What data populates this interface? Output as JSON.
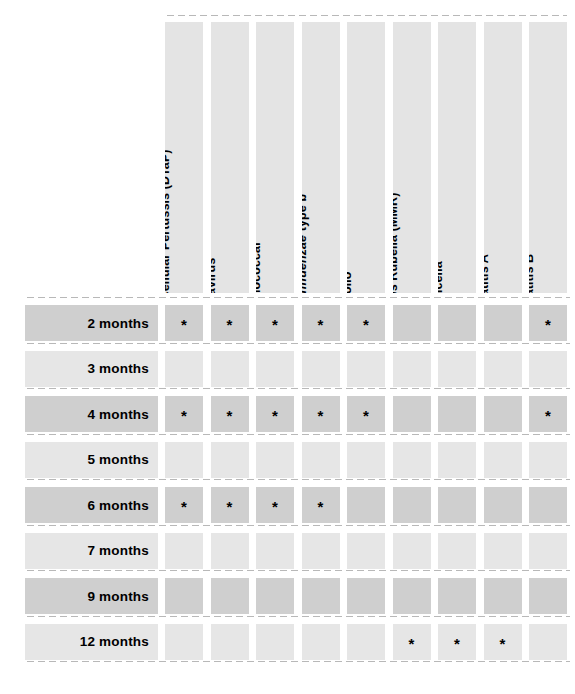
{
  "table": {
    "marker": "*",
    "colors": {
      "row_shade_dark": "#cfcfcf",
      "row_shade_light": "#e6e6e6",
      "header_shade": "#e4e4e4",
      "dot_color": "#b8b8b8",
      "text": "#000000",
      "background": "#ffffff"
    },
    "columns": [
      {
        "id": "dtap",
        "label": "Diphtheria Tetanus Acellular Pertussis (DTaP)",
        "italic_part": "",
        "roman_part": "Diphtheria Tetanus Acellular Pertussis (DTaP)"
      },
      {
        "id": "rotavirus",
        "label": "Rotavirus",
        "italic_part": "",
        "roman_part": "Rotavirus"
      },
      {
        "id": "pneumococcal",
        "label": "Pneumococcal",
        "italic_part": "",
        "roman_part": "Pneumococcal"
      },
      {
        "id": "hib",
        "label": "Haemophilus influenzae type b",
        "italic_part": "Haemophilus influenzae",
        "roman_part": " type b"
      },
      {
        "id": "polio",
        "label": "Polio",
        "italic_part": "",
        "roman_part": "Polio"
      },
      {
        "id": "mmr",
        "label": "Measles Mumps Rubella (MMR)",
        "italic_part": "",
        "roman_part": "Measles Mumps Rubella (MMR)"
      },
      {
        "id": "varicella",
        "label": "Varicella",
        "italic_part": "",
        "roman_part": "Varicella"
      },
      {
        "id": "hepatitis_a",
        "label": "Hepatitis A",
        "italic_part": "",
        "roman_part": "Hepatitis A"
      },
      {
        "id": "hepatitis_b",
        "label": "Hepatitis B",
        "italic_part": "",
        "roman_part": "Hepatitis B"
      }
    ],
    "rows": [
      {
        "id": "2-months",
        "label": "2 months",
        "shade": "dark",
        "marks": [
          true,
          true,
          true,
          true,
          true,
          false,
          false,
          false,
          true
        ]
      },
      {
        "id": "3-months",
        "label": "3 months",
        "shade": "light",
        "marks": [
          false,
          false,
          false,
          false,
          false,
          false,
          false,
          false,
          false
        ]
      },
      {
        "id": "4-months",
        "label": "4 months",
        "shade": "dark",
        "marks": [
          true,
          true,
          true,
          true,
          true,
          false,
          false,
          false,
          true
        ]
      },
      {
        "id": "5-months",
        "label": "5 months",
        "shade": "light",
        "marks": [
          false,
          false,
          false,
          false,
          false,
          false,
          false,
          false,
          false
        ]
      },
      {
        "id": "6-months",
        "label": "6 months",
        "shade": "dark",
        "marks": [
          true,
          true,
          true,
          true,
          false,
          false,
          false,
          false,
          false
        ]
      },
      {
        "id": "7-months",
        "label": "7 months",
        "shade": "light",
        "marks": [
          false,
          false,
          false,
          false,
          false,
          false,
          false,
          false,
          false
        ]
      },
      {
        "id": "9-months",
        "label": "9 months",
        "shade": "dark",
        "marks": [
          false,
          false,
          false,
          false,
          false,
          false,
          false,
          false,
          false
        ]
      },
      {
        "id": "12-months",
        "label": "12 months",
        "shade": "light",
        "marks": [
          false,
          false,
          false,
          false,
          false,
          true,
          true,
          true,
          false
        ]
      }
    ]
  },
  "layout": {
    "grid_left": 165,
    "col_pitch": 45.5,
    "col_width": 38,
    "header_top": 22,
    "header_height": 271,
    "rows_top": 305,
    "row_pitch": 45.5,
    "row_height": 36,
    "label_left": 25,
    "label_width": 133,
    "dot_left": 25,
    "dot_width": 545
  }
}
